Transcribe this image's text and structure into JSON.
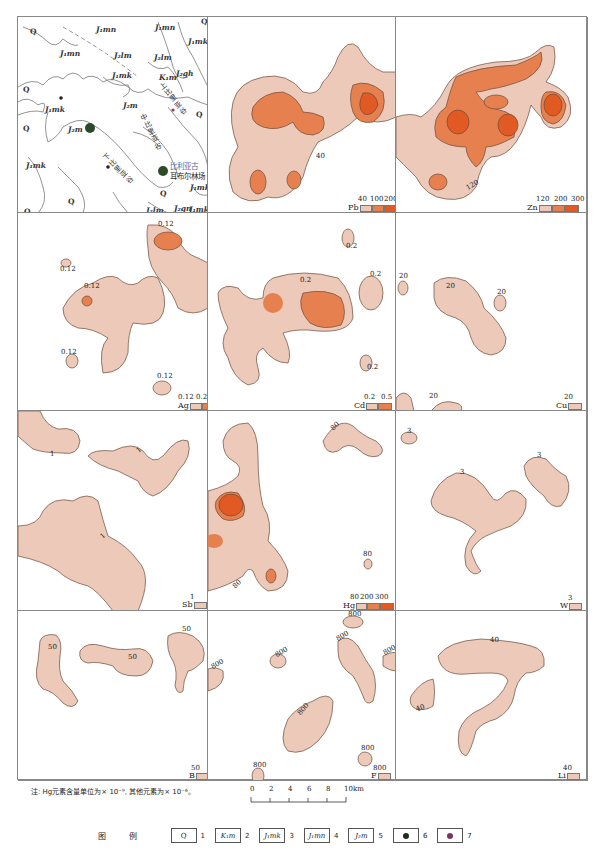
{
  "colors": {
    "low": "#ecc9b9",
    "mid": "#e6814f",
    "high": "#e25a23",
    "outline": "#6b4a3a",
    "geo_line": "#777777"
  },
  "geology_panel": {
    "labels": [
      {
        "text": "J₁mn",
        "x": 78,
        "y": 27
      },
      {
        "text": "J₁mn",
        "x": 48,
        "y": 52
      },
      {
        "text": "J₁mn",
        "x": 138,
        "y": 23
      },
      {
        "text": "J₁mk",
        "x": 185,
        "y": 36
      },
      {
        "text": "J₂lm",
        "x": 113,
        "y": 50
      },
      {
        "text": "J₂lm",
        "x": 150,
        "y": 52
      },
      {
        "text": "K₁m",
        "x": 157,
        "y": 70
      },
      {
        "text": "J₂gh",
        "x": 175,
        "y": 66
      },
      {
        "text": "J₁mk",
        "x": 110,
        "y": 70
      },
      {
        "text": "J₁mk",
        "x": 42,
        "y": 105
      },
      {
        "text": "J₂m",
        "x": 120,
        "y": 100
      },
      {
        "text": "J₂m",
        "x": 70,
        "y": 127
      },
      {
        "text": "J₁mk",
        "x": 25,
        "y": 160
      },
      {
        "text": "J₁mk",
        "x": 188,
        "y": 183
      },
      {
        "text": "J₂lm",
        "x": 145,
        "y": 208
      },
      {
        "text": "J₂gn",
        "x": 172,
        "y": 205
      },
      {
        "text": "J₁mk",
        "x": 188,
        "y": 205
      }
    ],
    "q_labels": [
      {
        "text": "Q",
        "x": 30,
        "y": 27
      },
      {
        "text": "Q",
        "x": 21,
        "y": 86
      },
      {
        "text": "Q",
        "x": 21,
        "y": 125
      },
      {
        "text": "Q",
        "x": 198,
        "y": 110
      },
      {
        "text": "Q",
        "x": 159,
        "y": 189
      },
      {
        "text": "Q",
        "x": 67,
        "y": 197
      },
      {
        "text": "Q",
        "x": 24,
        "y": 208
      },
      {
        "text": "Q",
        "x": 203,
        "y": 16
      }
    ],
    "valleys": [
      {
        "text": "上比里亚谷",
        "x": 168,
        "y": 85
      },
      {
        "text": "中比里亚谷",
        "x": 145,
        "y": 113
      },
      {
        "text": "下比里亚谷",
        "x": 117,
        "y": 148
      }
    ],
    "place_labels": [
      {
        "text": "比利亚古",
        "x": 167,
        "y": 163,
        "color": "#5a6aa8"
      },
      {
        "text": "耳布尔林场",
        "x": 167,
        "y": 173,
        "color": "#333333"
      }
    ]
  },
  "panels": [
    {
      "element": "Pb",
      "thresholds": [
        "40",
        "100",
        "200"
      ],
      "contour_labels": [
        "40"
      ]
    },
    {
      "element": "Zn",
      "thresholds": [
        "120",
        "200",
        "300"
      ],
      "contour_labels": [
        "120"
      ]
    },
    {
      "element": "Ag",
      "thresholds": [
        "0.12",
        "0.25"
      ],
      "contour_labels": [
        "0.12",
        "0.12",
        "0.12",
        "0.12",
        "0.12",
        "0.12"
      ]
    },
    {
      "element": "Cd",
      "thresholds": [
        "0.2",
        "0.5"
      ],
      "contour_labels": [
        "0.2",
        "0.2",
        "0.2",
        "0.2"
      ]
    },
    {
      "element": "Cu",
      "thresholds": [
        "20"
      ],
      "contour_labels": [
        "20",
        "20",
        "20",
        "20"
      ]
    },
    {
      "element": "Sb",
      "thresholds": [
        "1"
      ],
      "contour_labels": [
        "1",
        "1",
        "1"
      ]
    },
    {
      "element": "Hg",
      "thresholds": [
        "80",
        "200",
        "300"
      ],
      "contour_labels": [
        "80",
        "80",
        "80"
      ]
    },
    {
      "element": "W",
      "thresholds": [
        "3"
      ],
      "contour_labels": [
        "3",
        "3",
        "3"
      ]
    },
    {
      "element": "B",
      "thresholds": [
        "50"
      ],
      "contour_labels": [
        "50",
        "50",
        "50"
      ]
    },
    {
      "element": "F",
      "thresholds": [
        "800"
      ],
      "contour_labels": [
        "800",
        "800",
        "800",
        "800",
        "800",
        "800",
        "800",
        "800"
      ]
    },
    {
      "element": "Li",
      "thresholds": [
        "40"
      ],
      "contour_labels": [
        "40",
        "40"
      ]
    }
  ],
  "note": "注: Hg元素含量单位为× 10⁻⁹, 其他元素为× 10⁻⁶。",
  "scale_bar": {
    "ticks": [
      "0",
      "2",
      "4",
      "6",
      "8",
      "10km"
    ]
  },
  "legend": {
    "title": "图 例",
    "items": [
      {
        "symbol": "Q",
        "num": "1"
      },
      {
        "symbol": "K₁m",
        "num": "2"
      },
      {
        "symbol": "J₁mk",
        "num": "3"
      },
      {
        "symbol": "J₁mn",
        "num": "4"
      },
      {
        "symbol": "J₂m",
        "num": "5"
      },
      {
        "symbol": "black-dot",
        "num": "6"
      },
      {
        "symbol": "purple-dot",
        "num": "7"
      }
    ]
  }
}
